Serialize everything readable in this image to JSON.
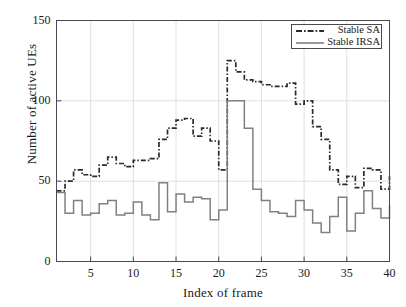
{
  "chart_data": {
    "type": "line",
    "style": "step-post",
    "title": "",
    "xlabel": "Index of frame",
    "ylabel": "Number of active UEs",
    "xlim": [
      1,
      40
    ],
    "ylim": [
      0,
      150
    ],
    "xticks": [
      5,
      10,
      15,
      20,
      25,
      30,
      35,
      40
    ],
    "yticks": [
      0,
      50,
      100,
      150
    ],
    "grid": true,
    "legend_position": "top-right",
    "x": [
      1,
      2,
      3,
      4,
      5,
      6,
      7,
      8,
      9,
      10,
      11,
      12,
      13,
      14,
      15,
      16,
      17,
      18,
      19,
      20,
      21,
      22,
      23,
      24,
      25,
      26,
      27,
      28,
      29,
      30,
      31,
      32,
      33,
      34,
      35,
      36,
      37,
      38,
      39,
      40
    ],
    "series": [
      {
        "name": "Stable SA",
        "linestyle": "dash-dot",
        "color": "#2a2a2a",
        "values": [
          44,
          50,
          57,
          54,
          53,
          60,
          65,
          61,
          59,
          63,
          63,
          64,
          76,
          83,
          88,
          89,
          78,
          83,
          75,
          57,
          125,
          118,
          113,
          112,
          110,
          109,
          109,
          111,
          98,
          100,
          84,
          76,
          57,
          48,
          53,
          46,
          58,
          57,
          45,
          53
        ]
      },
      {
        "name": "Stable IRSA",
        "linestyle": "solid",
        "color": "#808080",
        "values": [
          43,
          30,
          38,
          29,
          30,
          36,
          38,
          29,
          30,
          37,
          29,
          26,
          49,
          31,
          42,
          37,
          40,
          39,
          26,
          32,
          100,
          100,
          83,
          45,
          38,
          31,
          30,
          28,
          38,
          32,
          24,
          18,
          28,
          40,
          19,
          30,
          44,
          33,
          27,
          35
        ]
      }
    ]
  },
  "axes": {
    "ylabel": "Number of active UEs",
    "xlabel": "Index of frame",
    "ytick_labels": [
      "0",
      "50",
      "100",
      "150"
    ],
    "xtick_labels": [
      "5",
      "10",
      "15",
      "20",
      "25",
      "30",
      "35",
      "40"
    ]
  },
  "legend": {
    "entries": [
      {
        "label": "Stable SA",
        "style": "dash-dot",
        "color": "#2a2a2a"
      },
      {
        "label": "Stable IRSA",
        "style": "solid",
        "color": "#808080"
      }
    ]
  },
  "colors": {
    "background": "#ffffff",
    "axis": "#4a4a4a",
    "grid": "#d8d8d8",
    "series_sa": "#2a2a2a",
    "series_irsa": "#808080",
    "text": "#1a1a1a"
  }
}
